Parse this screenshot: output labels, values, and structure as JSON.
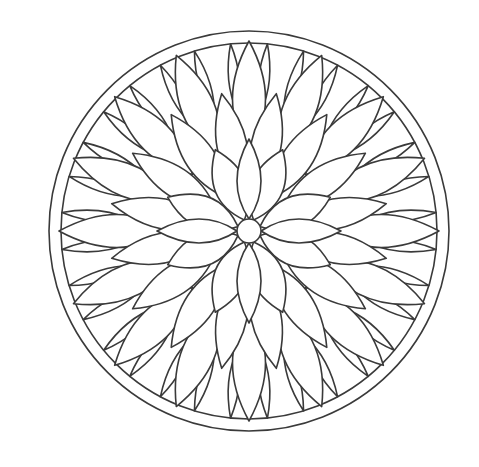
{
  "image": {
    "description": "Mandala coloring page - flower line art",
    "width": 479,
    "height": 467,
    "background": "#ffffff",
    "line_color": "#3a3a3a"
  },
  "mandala": {
    "center": [
      249,
      231
    ],
    "outer_circle_radius": 200,
    "inner_ring_radius": 188,
    "center_circle_radius": 12,
    "layers": [
      {
        "name": "outer-rim-petals",
        "count": 32,
        "inner_r": 120,
        "outer_r": 188,
        "width": 0.16,
        "offset_deg": 5.625
      },
      {
        "name": "large-outer-petals",
        "count": 16,
        "inner_r": 80,
        "outer_r": 190,
        "width": 0.3,
        "offset_deg": 0
      },
      {
        "name": "middle-petals",
        "count": 16,
        "inner_r": 40,
        "outer_r": 140,
        "width": 0.3,
        "offset_deg": 11.25
      },
      {
        "name": "inner-petals",
        "count": 8,
        "inner_r": 12,
        "outer_r": 88,
        "width": 0.42,
        "offset_deg": 22.5
      },
      {
        "name": "cross-petals",
        "count": 4,
        "inner_r": 12,
        "outer_r": 92,
        "width": 0.3,
        "offset_deg": 0
      }
    ]
  }
}
